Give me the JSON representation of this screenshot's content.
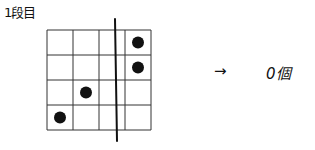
{
  "title": "1段目",
  "grid": {
    "rows": 4,
    "cols": 4,
    "divider_after_col_fraction": 2.5,
    "dots": [
      {
        "row": 1,
        "col": 4
      },
      {
        "row": 2,
        "col": 4
      },
      {
        "row": 3,
        "col": 2
      },
      {
        "row": 4,
        "col": 1
      }
    ]
  },
  "arrow": "→",
  "result": "0個",
  "colors": {
    "ink": "#111111",
    "background": "#ffffff"
  }
}
